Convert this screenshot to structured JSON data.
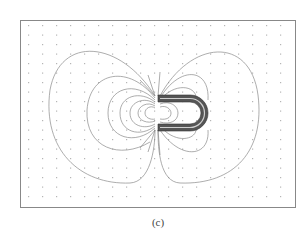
{
  "figure": {
    "type": "magnetic field line plot",
    "caption": "(c)",
    "colors": {
      "frame": "#888888",
      "field_lines": "#8a8a8a",
      "grid_dots": "#b5b5b5",
      "magnet": "#555555",
      "magnet_highlight": "#cfcfcf"
    }
  }
}
